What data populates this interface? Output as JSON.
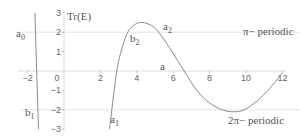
{
  "chart_data": {
    "type": "line",
    "title": "",
    "xlabel": "a",
    "ylabel": "Tr(E)",
    "xlim": [
      -2.5,
      12.2
    ],
    "ylim": [
      -3,
      3
    ],
    "grid": false,
    "x_ticks": [
      -2,
      0,
      2,
      4,
      6,
      8,
      10,
      12
    ],
    "y_ticks": [
      -3,
      -2,
      -1,
      0,
      1,
      2,
      3
    ],
    "x_tick_labels": [
      "-2",
      "0",
      "2",
      "4",
      "6",
      "8",
      "10",
      "12"
    ],
    "y_tick_labels": [
      "-3",
      "-2",
      "-1",
      "0",
      "1",
      "2",
      "3"
    ],
    "reference_lines": [
      {
        "y": 2,
        "label": "π− periodic"
      },
      {
        "y": -2,
        "label": "2π− periodic"
      }
    ],
    "series": [
      {
        "name": "Tr(E) left branch",
        "x": [
          -1.6,
          -1.55,
          -1.5,
          -1.45,
          -1.4
        ],
        "y": [
          3.0,
          1.5,
          0.0,
          -1.5,
          -3.0
        ]
      },
      {
        "name": "Tr(E)",
        "x": [
          2.5,
          2.9,
          3.2,
          3.5,
          3.9,
          4.3,
          4.8,
          5.2,
          5.8,
          6.6,
          7.3,
          8.0,
          8.7,
          9.3,
          9.9,
          10.6,
          11.3,
          12.0
        ],
        "y": [
          -3.0,
          0.0,
          1.2,
          2.0,
          2.4,
          2.5,
          2.35,
          2.0,
          1.2,
          0.0,
          -1.0,
          -1.65,
          -2.0,
          -2.1,
          -2.0,
          -1.55,
          -0.9,
          -0.1
        ]
      }
    ],
    "annotations": [
      {
        "text": "a",
        "sub": "0",
        "x": -2.2,
        "y": 1.8
      },
      {
        "text": "b",
        "sub": "1",
        "x": -2.2,
        "y": -2.2
      },
      {
        "text": "a",
        "sub": "1",
        "x": 3.2,
        "y": -2.6
      },
      {
        "text": "b",
        "sub": "2",
        "x": 3.6,
        "y": 1.6
      },
      {
        "text": "a",
        "sub": "2",
        "x": 5.2,
        "y": 2.1
      },
      {
        "text": "a",
        "sub": "",
        "x": 5.0,
        "y": 0.2
      },
      {
        "text": "Tr(E)",
        "sub": "",
        "x": 0.2,
        "y": 2.8
      },
      {
        "text": "π− periodic",
        "sub": "",
        "x": 9.7,
        "y": 2.1
      },
      {
        "text": "2π− periodic",
        "sub": "",
        "x": 9.0,
        "y": -2.65
      }
    ]
  },
  "labels": {
    "y_axis_title": "Tr(E)",
    "x_axis_title": "a",
    "pi_periodic": "π− periodic",
    "two_pi_periodic": "2π− periodic",
    "a0": "a",
    "a0_sub": "0",
    "b1": "b",
    "b1_sub": "1",
    "a1": "a",
    "a1_sub": "1",
    "b2": "b",
    "b2_sub": "2",
    "a2": "a",
    "a2_sub": "2"
  }
}
